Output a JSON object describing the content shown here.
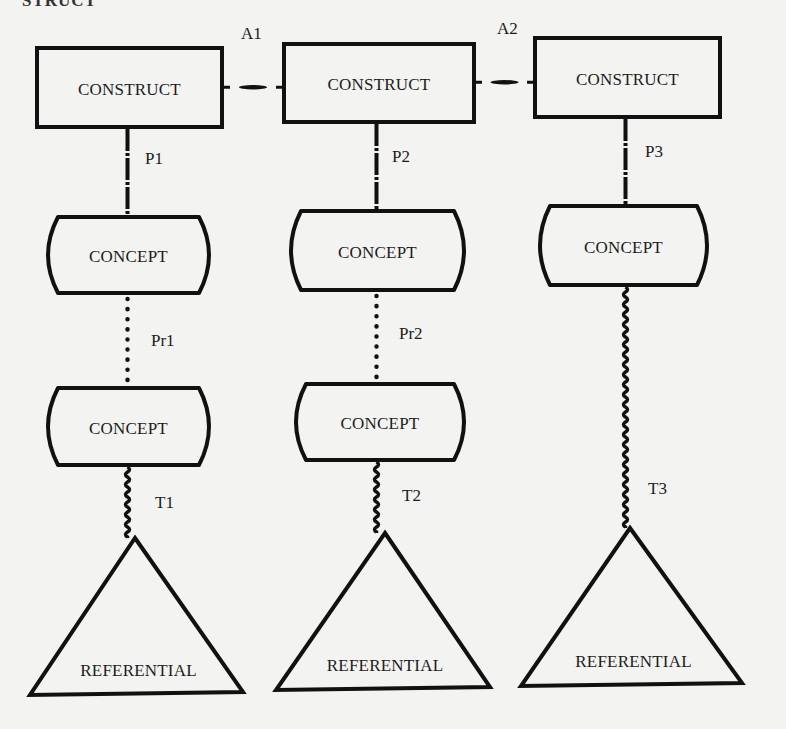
{
  "figure": {
    "cut_heading": "STRUCT",
    "stroke_color": "#111111",
    "background": "#f3f3f1"
  },
  "columns": [
    {
      "construct": {
        "label": "CONSTRUCT",
        "x": 37,
        "y": 48,
        "w": 185,
        "h": 79
      },
      "link_construct_concept": {
        "label": "P1",
        "style": "dash-dot"
      },
      "concept_top": {
        "label": "CONCEPT",
        "x": 42,
        "y": 217,
        "w": 173,
        "h": 76
      },
      "link_concept_concept": {
        "label": "Pr1",
        "style": "dotted"
      },
      "concept_bottom": {
        "label": "CONCEPT",
        "x": 42,
        "y": 388,
        "w": 173,
        "h": 77
      },
      "link_concept_referential": {
        "label": "T1",
        "style": "wavy"
      },
      "referential": {
        "label": "REFERENTIAL",
        "apex": [
          135,
          538
        ],
        "base_left": [
          30,
          695
        ],
        "base_right": [
          243,
          692
        ]
      }
    },
    {
      "construct": {
        "label": "CONSTRUCT",
        "x": 284,
        "y": 44,
        "w": 190,
        "h": 78
      },
      "link_construct_concept": {
        "label": "P2",
        "style": "dash-dot"
      },
      "concept_top": {
        "label": "CONCEPT",
        "x": 285,
        "y": 211,
        "w": 185,
        "h": 79
      },
      "link_concept_concept": {
        "label": "Pr2",
        "style": "dotted"
      },
      "concept_bottom": {
        "label": "CONCEPT",
        "x": 290,
        "y": 384,
        "w": 180,
        "h": 76
      },
      "link_concept_referential": {
        "label": "T2",
        "style": "wavy"
      },
      "referential": {
        "label": "REFERENTIAL",
        "apex": [
          385,
          533
        ],
        "base_left": [
          276,
          690
        ],
        "base_right": [
          490,
          687
        ]
      }
    },
    {
      "construct": {
        "label": "CONSTRUCT",
        "x": 535,
        "y": 38,
        "w": 185,
        "h": 79
      },
      "link_construct_concept": {
        "label": "P3",
        "style": "dash-dot"
      },
      "concept_top": {
        "label": "CONCEPT",
        "x": 534,
        "y": 206,
        "w": 179,
        "h": 79
      },
      "link_concept_referential": {
        "label": "T3",
        "style": "wavy"
      },
      "referential": {
        "label": "REFERENTIAL",
        "apex": [
          630,
          528
        ],
        "base_left": [
          521,
          686
        ],
        "base_right": [
          742,
          683
        ]
      }
    }
  ],
  "horizontal_links": [
    {
      "label": "A1",
      "from_col": 0,
      "to_col": 1,
      "style": "dash"
    },
    {
      "label": "A2",
      "from_col": 1,
      "to_col": 2,
      "style": "dash"
    }
  ]
}
